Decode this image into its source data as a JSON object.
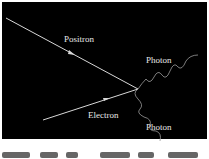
{
  "diagram": {
    "type": "feynman-annihilation",
    "background": "#000000",
    "line_color": "#d8d8d8",
    "particles": [
      {
        "label": "Positron",
        "role": "incoming"
      },
      {
        "label": "Electron",
        "role": "incoming"
      },
      {
        "label": "Photon",
        "role": "outgoing"
      },
      {
        "label": "Photon",
        "role": "outgoing"
      }
    ]
  }
}
